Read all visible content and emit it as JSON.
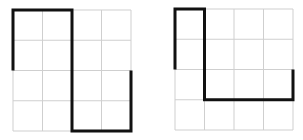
{
  "colors": {
    "grid": "#cfcfcf",
    "path": "#111111",
    "background": "#ffffff"
  },
  "grids": [
    {
      "name": "left-grid",
      "x": 13,
      "y": 10,
      "width": 118,
      "height": 121,
      "cols": 4,
      "rows": 4,
      "path": [
        [
          0,
          2
        ],
        [
          0,
          0
        ],
        [
          2,
          0
        ],
        [
          2,
          4
        ],
        [
          4,
          4
        ],
        [
          4,
          2
        ]
      ]
    },
    {
      "name": "right-grid",
      "x": 175,
      "y": 9,
      "width": 118,
      "height": 121,
      "cols": 4,
      "rows": 4,
      "path": [
        [
          0,
          2
        ],
        [
          0,
          0
        ],
        [
          1,
          0
        ],
        [
          1,
          3
        ],
        [
          4,
          3
        ],
        [
          4,
          2
        ]
      ]
    }
  ]
}
